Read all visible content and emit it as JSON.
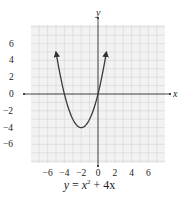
{
  "chart_data": {
    "type": "line",
    "equation": {
      "lhs": "y",
      "rhs_var": "x",
      "rhs_exp": "2",
      "rhs_rest": "+ 4x"
    },
    "xlabel": "x",
    "ylabel": "y",
    "xlim": [
      -8,
      8
    ],
    "ylim": [
      -8,
      8
    ],
    "xticks": [
      -6,
      -4,
      -2,
      0,
      2,
      4,
      6
    ],
    "yticks": [
      6,
      4,
      2,
      0,
      -2,
      -4,
      -6
    ],
    "grid": true,
    "grid_step": 1,
    "series": [
      {
        "name": "y = x^2 + 4x",
        "x": [
          -5,
          -4.5,
          -4,
          -3.5,
          -3,
          -2.5,
          -2,
          -1.5,
          -1,
          -0.5,
          0,
          0.5,
          1
        ],
        "y": [
          5,
          2.25,
          0,
          -1.75,
          -3,
          -3.75,
          -4,
          -3.75,
          -3,
          -1.75,
          0,
          2.25,
          5
        ],
        "arrows_at_ends": true
      }
    ],
    "vertex": [
      -2,
      -4
    ],
    "x_intercepts": [
      -4,
      0
    ],
    "colors": {
      "grid": "#d4d4d4",
      "axis": "#333333",
      "curve": "#3a3a3a",
      "background": "#f2f2f2"
    }
  }
}
